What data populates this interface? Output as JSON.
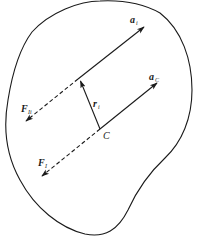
{
  "diagram": {
    "title": "",
    "colors": {
      "stroke": "#1a1a1a",
      "background": "#ffffff"
    },
    "labels": {
      "a_i": {
        "main": "a",
        "sub": "i"
      },
      "a_C": {
        "main": "a",
        "sub": "C"
      },
      "F_Ii": {
        "main": "F",
        "sub": "Ii"
      },
      "F_I": {
        "main": "F",
        "sub": "I"
      },
      "r_i": {
        "main": "r",
        "sub": "i"
      },
      "C": {
        "main": "C"
      }
    },
    "elements": [
      {
        "id": "body-outline",
        "type": "closed-curve"
      },
      {
        "id": "vector-a_i",
        "type": "solid-arrow",
        "from": [
          78,
          79
        ],
        "to": [
          144,
          27
        ]
      },
      {
        "id": "vector-a_C",
        "type": "solid-arrow",
        "from": [
          100,
          129
        ],
        "to": [
          157,
          83
        ]
      },
      {
        "id": "vector-F_Ii",
        "type": "dashed-arrow",
        "from": [
          78,
          79
        ],
        "to": [
          26,
          121
        ]
      },
      {
        "id": "vector-F_I",
        "type": "dashed-arrow",
        "from": [
          100,
          129
        ],
        "to": [
          42,
          176
        ]
      },
      {
        "id": "vector-r_i",
        "type": "solid-arrow",
        "from": [
          100,
          129
        ],
        "to": [
          80,
          81
        ]
      },
      {
        "id": "point-C",
        "type": "point",
        "at": [
          100,
          129
        ]
      }
    ]
  }
}
